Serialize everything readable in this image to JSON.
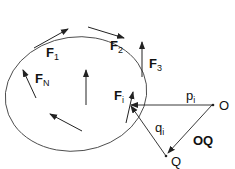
{
  "diagram": {
    "labels": {
      "f1": "F",
      "f1_sub": "1",
      "f2": "F",
      "f2_sub": "2",
      "f3": "F",
      "f3_sub": "3",
      "fn": "F",
      "fn_sub": "N",
      "fi": "F",
      "fi_sub": "i",
      "pi": "p",
      "pi_sub": "i",
      "qi": "q",
      "qi_sub": "i",
      "o": "O",
      "q": "Q",
      "oq": "OQ"
    },
    "colors": {
      "stroke": "#222222",
      "text": "#111111"
    }
  }
}
